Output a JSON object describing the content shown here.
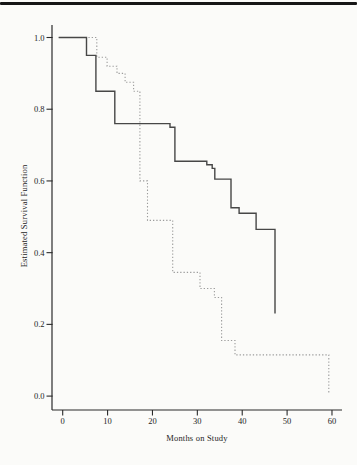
{
  "page": {
    "background_color": "#fbfbf9",
    "top_rule_color": "#161616"
  },
  "chart_data": {
    "type": "line",
    "chart_kind": "kaplan-meier-step-survival",
    "title": "",
    "xlabel": "Months on Study",
    "ylabel": "Estimated Survival Function",
    "xlim": [
      0,
      62
    ],
    "ylim": [
      0.0,
      1.0
    ],
    "grid": false,
    "legend": "none",
    "x_ticks": [
      {
        "v": 0,
        "label": "0"
      },
      {
        "v": 10,
        "label": "10"
      },
      {
        "v": 20,
        "label": "20"
      },
      {
        "v": 30,
        "label": "30"
      },
      {
        "v": 40,
        "label": "40"
      },
      {
        "v": 50,
        "label": "50"
      },
      {
        "v": 60,
        "label": "60"
      }
    ],
    "y_ticks": [
      {
        "v": 1.0,
        "label": "1.0"
      },
      {
        "v": 0.8,
        "label": "0.8"
      },
      {
        "v": 0.6,
        "label": "0.6"
      },
      {
        "v": 0.4,
        "label": "0.4"
      },
      {
        "v": 0.2,
        "label": "0.2"
      },
      {
        "v": 0.0,
        "label": "0.0"
      }
    ],
    "series": [
      {
        "name": "dotted-group",
        "line_style": "dotted",
        "color": "#9c9c9c",
        "steps": [
          [
            0,
            1.0
          ],
          [
            7.6,
            0.945
          ],
          [
            9.9,
            0.92
          ],
          [
            12.1,
            0.9
          ],
          [
            13.9,
            0.875
          ],
          [
            15.8,
            0.85
          ],
          [
            17.2,
            0.6
          ],
          [
            18.9,
            0.49
          ],
          [
            24.5,
            0.345
          ],
          [
            30.6,
            0.3
          ],
          [
            33.8,
            0.275
          ],
          [
            35.4,
            0.155
          ],
          [
            38.4,
            0.115
          ],
          [
            59.3,
            0.005
          ]
        ]
      },
      {
        "name": "solid-group",
        "line_style": "solid",
        "color": "#474747",
        "steps": [
          [
            0,
            1.0
          ],
          [
            5.3,
            0.95
          ],
          [
            7.4,
            0.85
          ],
          [
            11.6,
            0.76
          ],
          [
            23.9,
            0.75
          ],
          [
            25.0,
            0.655
          ],
          [
            32.1,
            0.645
          ],
          [
            33.3,
            0.635
          ],
          [
            33.9,
            0.605
          ],
          [
            37.5,
            0.525
          ],
          [
            39.3,
            0.51
          ],
          [
            43.1,
            0.465
          ],
          [
            47.3,
            0.23
          ]
        ]
      }
    ]
  }
}
